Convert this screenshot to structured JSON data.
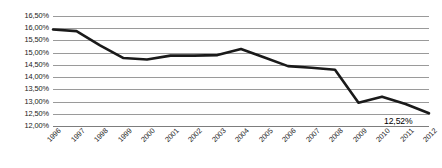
{
  "chart_data": {
    "type": "line",
    "title": "",
    "subtitle": "",
    "xlabel": "",
    "ylabel": "",
    "categories": [
      "1996",
      "1997",
      "1998",
      "1999",
      "2000",
      "2001",
      "2002",
      "2003",
      "2004",
      "2005",
      "2006",
      "2007",
      "2008",
      "2009",
      "2010",
      "2011",
      "2012"
    ],
    "values": [
      15.95,
      15.88,
      15.3,
      14.78,
      14.72,
      14.88,
      14.88,
      14.9,
      15.15,
      14.8,
      14.45,
      14.38,
      14.3,
      12.95,
      13.2,
      12.9,
      12.52
    ],
    "series": [
      {
        "name": "",
        "values": [
          15.95,
          15.88,
          15.3,
          14.78,
          14.72,
          14.88,
          14.88,
          14.9,
          15.15,
          14.8,
          14.45,
          14.38,
          14.3,
          12.95,
          13.2,
          12.9,
          12.52
        ]
      }
    ],
    "ylim": [
      12.0,
      16.5
    ],
    "ytick_values": [
      16.5,
      16.0,
      15.5,
      15.0,
      14.5,
      14.0,
      13.5,
      13.0,
      12.5,
      12.0
    ],
    "ytick_labels": [
      "16,50%",
      "16,00%",
      "15,50%",
      "15,00%",
      "14,50%",
      "14,00%",
      "13,50%",
      "13,00%",
      "12,50%",
      "12,00%"
    ],
    "grid": true,
    "legend": false,
    "legend_position": "none",
    "decimal_separator": ",",
    "unit": "%",
    "annotations": [
      {
        "label": "12,52%",
        "category": "2012",
        "value": 12.52
      }
    ],
    "colors": {
      "series_line": "#1a1a1a",
      "gridline": "#9a9a9a",
      "axis": "#7d7d7d",
      "label_text": "#1a1a1a",
      "background": "#ffffff"
    },
    "line_width_px": 2.6
  }
}
